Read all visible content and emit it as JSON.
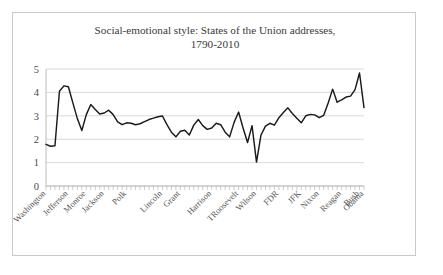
{
  "chart_data": {
    "type": "line",
    "title": "Social-emotional style: States of the Union addresses, 1790-2010",
    "title_line1": "Social-emotional style: States of the Union addresses,",
    "title_line2": "1790-2010",
    "xlabel": "",
    "ylabel": "",
    "ylim": [
      0,
      5
    ],
    "ytick_labels": [
      "0",
      "1",
      "2",
      "3",
      "4",
      "5"
    ],
    "yticks": [
      0,
      1,
      2,
      3,
      4,
      5
    ],
    "grid": true,
    "legend": "none",
    "line_color": "#1a1a1a",
    "grid_color": "#d0d0d0",
    "axis_color": "#b5b5b5",
    "tick_labels": [
      "Washington",
      "Jefferson",
      "Monroe",
      "Jackson",
      "Polk",
      "Lincoln",
      "Grant",
      "Harrison",
      "TRoosevelt",
      "Wilson",
      "FDR",
      "JFK",
      "Nixon",
      "Reagan",
      "Bush",
      "Obama"
    ],
    "tick_label_indices": [
      0,
      5,
      9,
      13,
      18,
      26,
      30,
      37,
      43,
      47,
      52,
      57,
      61,
      66,
      70,
      71
    ],
    "values": [
      1.78,
      1.7,
      1.72,
      4.05,
      4.28,
      4.24,
      3.55,
      2.88,
      2.37,
      3.05,
      3.48,
      3.27,
      3.08,
      3.12,
      3.24,
      3.05,
      2.74,
      2.62,
      2.7,
      2.68,
      2.62,
      2.66,
      2.75,
      2.84,
      2.9,
      2.96,
      2.99,
      2.62,
      2.3,
      2.1,
      2.34,
      2.38,
      2.18,
      2.6,
      2.84,
      2.58,
      2.42,
      2.48,
      2.68,
      2.62,
      2.3,
      2.1,
      2.72,
      3.16,
      2.48,
      1.86,
      2.58,
      1.02,
      2.18,
      2.56,
      2.68,
      2.6,
      2.92,
      3.14,
      3.34,
      3.1,
      2.9,
      2.7,
      3.0,
      3.06,
      3.04,
      2.92,
      3.02,
      3.55,
      4.14,
      3.58,
      3.68,
      3.8,
      3.84,
      4.12,
      4.83,
      3.35
    ]
  }
}
